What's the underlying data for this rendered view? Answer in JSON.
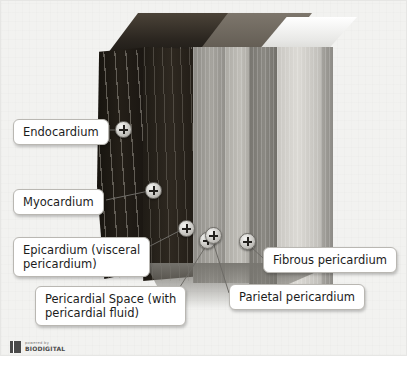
{
  "diagram": {
    "background_color": "#f2f2f0"
  },
  "labels": [
    {
      "id": "endocardium",
      "text": "Endocardium"
    },
    {
      "id": "myocardium",
      "text": "Myocardium"
    },
    {
      "id": "epicardium",
      "text": "Epicardium (visceral\npericardium)"
    },
    {
      "id": "pericardial-space",
      "text": "Pericardial Space (with\npericardial fluid)"
    },
    {
      "id": "parietal",
      "text": "Parietal pericardium"
    },
    {
      "id": "fibrous",
      "text": "Fibrous pericardium"
    }
  ],
  "markers": [
    {
      "id": "endocardium",
      "glyph": "+"
    },
    {
      "id": "myocardium",
      "glyph": "+"
    },
    {
      "id": "epicardium",
      "glyph": "+"
    },
    {
      "id": "pericardial-space",
      "glyph": "+"
    },
    {
      "id": "parietal",
      "glyph": "+"
    },
    {
      "id": "fibrous",
      "glyph": "+"
    }
  ],
  "watermark": {
    "line1": "powered by",
    "line2": "BIODIGITAL"
  }
}
